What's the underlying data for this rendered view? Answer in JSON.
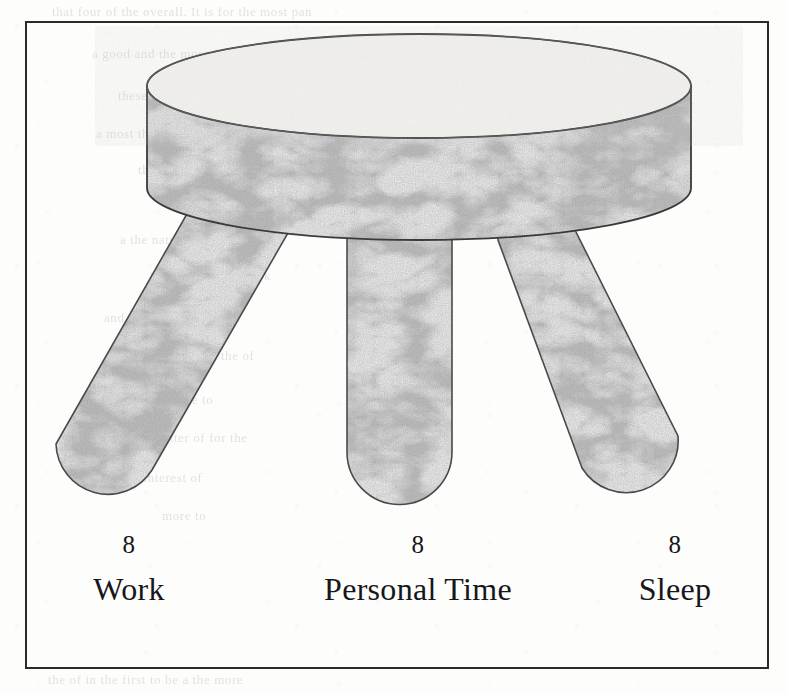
{
  "figure": {
    "kind": "three-legged-stool-diagram",
    "frame_border_color": "#2b2b2b",
    "background_color": "#fdfdfc"
  },
  "stool": {
    "seat": {
      "name": "stool-seat",
      "top_surface_color": "#f2f1ee",
      "side_fill": "marble-texture",
      "outline_color": "#3a3a3a"
    },
    "legs": [
      {
        "name": "leg-work",
        "orientation": "splayed-left"
      },
      {
        "name": "leg-personal-time",
        "orientation": "vertical"
      },
      {
        "name": "leg-sleep",
        "orientation": "splayed-right"
      }
    ],
    "texture": {
      "name": "marble-texture",
      "base_color": "#8d8d8d",
      "dark_color": "#5e5e5e",
      "light_color": "#dedede"
    }
  },
  "chart_data": {
    "type": "bar",
    "title": "",
    "subtitle": "",
    "xlabel": "",
    "ylabel": "",
    "categories": [
      "Work",
      "Personal Time",
      "Sleep"
    ],
    "values": [
      8,
      8,
      8
    ],
    "unit": "hours",
    "total": 24,
    "grid": false,
    "legend": "none",
    "ylim": [
      0,
      8
    ]
  },
  "captions": [
    {
      "value": "8",
      "label": "Work"
    },
    {
      "value": "8",
      "label": "Personal Time"
    },
    {
      "value": "8",
      "label": "Sleep"
    }
  ],
  "bleed_through": {
    "lines": [
      {
        "text": "that four of the overall. It is for the most pan",
        "x": 52,
        "y": 4
      },
      {
        "text": "a good and the more for the reserve as",
        "x": 92,
        "y": 46
      },
      {
        "text": "these of another others the",
        "x": 118,
        "y": 88
      },
      {
        "text": "a most the constant improvement",
        "x": 96,
        "y": 126
      },
      {
        "text": "the of the forms to the",
        "x": 138,
        "y": 162
      },
      {
        "text": "all in the more",
        "x": 176,
        "y": 196
      },
      {
        "text": "a the nature. There are",
        "x": 120,
        "y": 232
      },
      {
        "text": "the same of the work",
        "x": 150,
        "y": 268
      },
      {
        "text": "and in the forms for the",
        "x": 104,
        "y": 310
      },
      {
        "text": "the more and the of",
        "x": 142,
        "y": 348
      },
      {
        "text": "one in the more to",
        "x": 108,
        "y": 392
      },
      {
        "text": "a better of for the",
        "x": 146,
        "y": 430
      },
      {
        "text": "the interest of",
        "x": 122,
        "y": 470
      },
      {
        "text": "more to",
        "x": 162,
        "y": 508
      },
      {
        "text": "the of in the first to be a the more",
        "x": 48,
        "y": 672
      }
    ]
  }
}
